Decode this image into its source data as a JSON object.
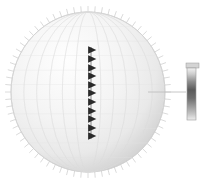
{
  "figure": {
    "title": "",
    "background_color": "#ffffff",
    "width": 214,
    "height": 185
  },
  "chart_data": {
    "type": "scatter",
    "title": "",
    "subtitle": "",
    "xlabel": "",
    "ylabel": "",
    "projection": "orthographic-sphere",
    "grid": true,
    "legend_position": "right",
    "sphere": {
      "center_x": 88,
      "center_y": 92,
      "radius_x": 77,
      "radius_y": 80,
      "fill_light": "#fefefe",
      "fill_mid": "#e9e9e9",
      "fill_dark": "#c8c8c8",
      "outline_color": "#b8b8b8",
      "meridian_count": 13,
      "parallel_count": 11,
      "meridian_color": "#dcdcdc",
      "parallel_color": "#e2e2e2"
    },
    "limb_ticks": {
      "count": 72,
      "length": 6,
      "color": "#b0b0b0",
      "note": "radial tick marks projecting outward from sphere limb"
    },
    "markers": {
      "name": "triangle-marker-column",
      "shape": "triangle",
      "color": "#2a2a2a",
      "count": 11,
      "x": 92,
      "y_start": 50,
      "y_end": 136,
      "size": 7,
      "values": [
        {
          "index": 1,
          "x": 92,
          "y": 50
        },
        {
          "index": 2,
          "x": 92,
          "y": 59
        },
        {
          "index": 3,
          "x": 92,
          "y": 68
        },
        {
          "index": 4,
          "x": 92,
          "y": 76
        },
        {
          "index": 5,
          "x": 92,
          "y": 85
        },
        {
          "index": 6,
          "x": 92,
          "y": 93
        },
        {
          "index": 7,
          "x": 92,
          "y": 102
        },
        {
          "index": 8,
          "x": 92,
          "y": 111
        },
        {
          "index": 9,
          "x": 92,
          "y": 119
        },
        {
          "index": 10,
          "x": 92,
          "y": 128
        },
        {
          "index": 11,
          "x": 92,
          "y": 136
        }
      ]
    },
    "leader_line": {
      "x1": 148,
      "y1": 92,
      "x2": 186,
      "y2": 92,
      "color": "#c0c0c0"
    },
    "colorbar": {
      "orientation": "vertical",
      "x": 187,
      "y": 68,
      "width": 9,
      "height": 52,
      "border_color": "#9a9a9a",
      "cap_color": "#d4d4d4",
      "cap_x": 186,
      "cap_y": 63,
      "cap_width": 13,
      "cap_height": 5,
      "gradient_stops": [
        {
          "offset": 0.0,
          "color": "#f2f2f2"
        },
        {
          "offset": 0.12,
          "color": "#cccccc"
        },
        {
          "offset": 0.26,
          "color": "#8e8e8e"
        },
        {
          "offset": 0.42,
          "color": "#5a5a5a"
        },
        {
          "offset": 0.58,
          "color": "#6e6e6e"
        },
        {
          "offset": 0.74,
          "color": "#9c9c9c"
        },
        {
          "offset": 0.88,
          "color": "#c4c4c4"
        },
        {
          "offset": 1.0,
          "color": "#ededed"
        }
      ],
      "tick_labels": [],
      "caption": ""
    },
    "colors": {
      "accent": "#2a2a2a",
      "sphere_shade": "#d9d9d9",
      "outline": "#b8b8b8",
      "background": "#ffffff"
    }
  }
}
